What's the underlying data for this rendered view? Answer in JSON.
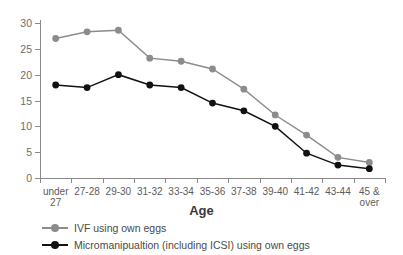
{
  "chart_data": {
    "type": "line",
    "title": "",
    "xlabel": "Age",
    "ylabel": "",
    "ylim": [
      0,
      30
    ],
    "yticks": [
      0,
      5,
      10,
      15,
      20,
      25,
      30
    ],
    "grid": false,
    "legend_position": "bottom-left",
    "categories": [
      "under 27",
      "27-28",
      "29-30",
      "31-32",
      "33-34",
      "35-36",
      "37-38",
      "39-40",
      "41-42",
      "43-44",
      "45 & over"
    ],
    "series": [
      {
        "name": "IVF using own eggs",
        "color": "#8c8c8c",
        "marker": "circle",
        "values": [
          27.0,
          28.3,
          28.6,
          23.2,
          22.6,
          21.1,
          17.2,
          12.2,
          8.3,
          4.0,
          3.0
        ]
      },
      {
        "name": "Micromanipualtion (including ICSI) using own eggs",
        "color": "#111111",
        "marker": "circle",
        "values": [
          18.0,
          17.5,
          20.0,
          18.0,
          17.5,
          14.5,
          13.0,
          10.0,
          4.8,
          2.5,
          1.8
        ]
      }
    ]
  },
  "axis": {
    "y_tick_labels": [
      "0",
      "5",
      "10",
      "15",
      "20",
      "25",
      "30"
    ],
    "x_tick_labels": [
      "under\n27",
      "27-28",
      "29-30",
      "31-32",
      "33-34",
      "35-36",
      "37-38",
      "39-40",
      "41-42",
      "43-44",
      "45 &\nover"
    ],
    "x_title": "Age"
  },
  "legend": {
    "items": [
      {
        "label": "IVF using own eggs",
        "color": "#8c8c8c"
      },
      {
        "label": "Micromanipualtion (including ICSI) using own eggs",
        "color": "#111111"
      }
    ]
  },
  "colors": {
    "series_ivf": "#8c8c8c",
    "series_icsi": "#111111",
    "axis": "#8a8a8a",
    "text": "#4a4a4a",
    "background": "#ffffff"
  }
}
